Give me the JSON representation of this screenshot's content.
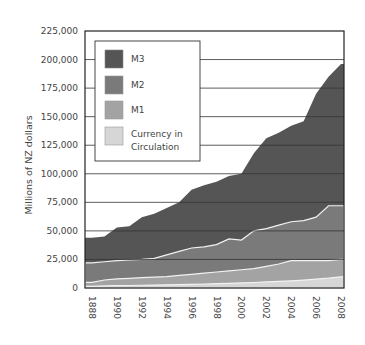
{
  "chart_data": {
    "type": "area",
    "stacked": false,
    "title": "",
    "xlabel": "",
    "ylabel": "Millions of NZ dollars",
    "ylim": [
      0,
      225000
    ],
    "yticks": [
      0,
      25000,
      50000,
      75000,
      100000,
      125000,
      150000,
      175000,
      200000,
      225000
    ],
    "ytick_labels": [
      "0",
      "25,000",
      "50,000",
      "75,000",
      "100,000",
      "125,000",
      "150,000",
      "175,000",
      "200,000",
      "225,000"
    ],
    "xtick_labels": [
      "1888",
      "1990",
      "1992",
      "1994",
      "1996",
      "1998",
      "2000",
      "2002",
      "2004",
      "2006",
      "2008"
    ],
    "grid": "horizontal",
    "legend_position": "upper left (inside)",
    "x": [
      1988,
      1989,
      1990,
      1991,
      1992,
      1993,
      1994,
      1995,
      1996,
      1997,
      1998,
      1999,
      2000,
      2001,
      2002,
      2003,
      2004,
      2005,
      2006,
      2007,
      2008
    ],
    "series": [
      {
        "name": "M3",
        "color": "#555555",
        "values": [
          44000,
          45000,
          53000,
          54000,
          62000,
          65000,
          70000,
          75000,
          86000,
          90000,
          93000,
          98000,
          100000,
          118000,
          131000,
          136000,
          142000,
          146000,
          170000,
          185000,
          196000
        ]
      },
      {
        "name": "M2",
        "color": "#7a7a7a",
        "values": [
          22000,
          23000,
          24000,
          24500,
          25000,
          26000,
          29000,
          32000,
          35000,
          36000,
          38000,
          43000,
          42000,
          50000,
          52000,
          55000,
          58000,
          59000,
          62000,
          72000,
          72000
        ]
      },
      {
        "name": "M1",
        "color": "#a3a3a3",
        "values": [
          5000,
          7000,
          8000,
          8500,
          9000,
          9500,
          10000,
          11000,
          12000,
          13000,
          14000,
          15000,
          16000,
          17000,
          19000,
          21000,
          24000,
          24000,
          24000,
          24000,
          25000
        ]
      },
      {
        "name": "Currency in Circulation",
        "color": "#d6d6d6",
        "values": [
          1500,
          1800,
          2000,
          2200,
          2400,
          2600,
          2800,
          3000,
          3200,
          3500,
          3800,
          4100,
          4400,
          4800,
          5300,
          5800,
          6300,
          6900,
          7700,
          8600,
          9800
        ]
      }
    ]
  },
  "legend": {
    "items": [
      {
        "label": "M3",
        "color": "#555555"
      },
      {
        "label": "M2",
        "color": "#7a7a7a"
      },
      {
        "label": "M1",
        "color": "#a3a3a3"
      },
      {
        "label_line1": "Currency in",
        "label_line2": "Circulation",
        "color": "#d6d6d6"
      }
    ]
  },
  "axis": {
    "ylabel": "Millions of NZ dollars"
  }
}
